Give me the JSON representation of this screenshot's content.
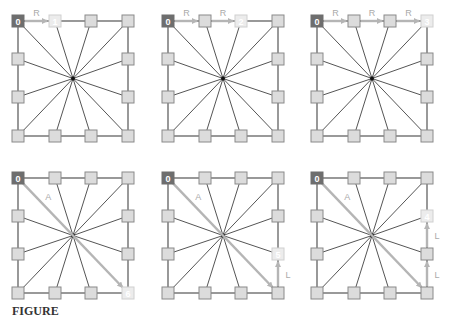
{
  "colors": {
    "background": "#ffffff",
    "edge": "#555555",
    "node_fill": "#dcdcdc",
    "node_stroke": "#8a8a8a",
    "start_fill": "#6e6e6e",
    "target_fill": "#ececec",
    "target_stroke": "#d0d0d0",
    "path": "#b5b5b5",
    "label": "#aaaaaa",
    "center": "#111111"
  },
  "grid": {
    "cols_offsets": [
      0,
      37,
      73,
      110
    ],
    "rows_offsets": [
      0,
      38,
      76,
      115
    ],
    "node_size": 12
  },
  "panels": [
    {
      "id": "panel-1",
      "origin": [
        18,
        21
      ],
      "start_label": "0",
      "target": {
        "col": 1,
        "row": 0,
        "label": "1"
      },
      "path": [
        {
          "from": [
            0,
            0
          ],
          "to": [
            1,
            0
          ],
          "label": "R"
        }
      ]
    },
    {
      "id": "panel-2",
      "origin": [
        168,
        21
      ],
      "start_label": "0",
      "target": {
        "col": 2,
        "row": 0,
        "label": "2"
      },
      "path": [
        {
          "from": [
            0,
            0
          ],
          "to": [
            1,
            0
          ],
          "label": "R"
        },
        {
          "from": [
            1,
            0
          ],
          "to": [
            2,
            0
          ],
          "label": "R"
        }
      ]
    },
    {
      "id": "panel-3",
      "origin": [
        317,
        21
      ],
      "start_label": "0",
      "target": {
        "col": 3,
        "row": 0,
        "label": "3"
      },
      "path": [
        {
          "from": [
            0,
            0
          ],
          "to": [
            1,
            0
          ],
          "label": "R"
        },
        {
          "from": [
            1,
            0
          ],
          "to": [
            2,
            0
          ],
          "label": "R"
        },
        {
          "from": [
            2,
            0
          ],
          "to": [
            3,
            0
          ],
          "label": "R"
        }
      ]
    },
    {
      "id": "panel-4",
      "origin": [
        18,
        178
      ],
      "start_label": "0",
      "target": {
        "col": 3,
        "row": 3,
        "label": "6"
      },
      "path": [
        {
          "from": [
            0,
            0
          ],
          "to": [
            3,
            3
          ],
          "label": "A"
        }
      ]
    },
    {
      "id": "panel-5",
      "origin": [
        168,
        178
      ],
      "start_label": "0",
      "target": {
        "col": 3,
        "row": 2,
        "label": "5"
      },
      "path": [
        {
          "from": [
            0,
            0
          ],
          "to": [
            3,
            3
          ],
          "label": "A"
        },
        {
          "from": [
            3,
            3
          ],
          "to": [
            3,
            2
          ],
          "label": "L"
        }
      ]
    },
    {
      "id": "panel-6",
      "origin": [
        317,
        178
      ],
      "start_label": "0",
      "target": {
        "col": 3,
        "row": 1,
        "label": "4"
      },
      "path": [
        {
          "from": [
            0,
            0
          ],
          "to": [
            3,
            3
          ],
          "label": "A"
        },
        {
          "from": [
            3,
            3
          ],
          "to": [
            3,
            2
          ],
          "label": "L"
        },
        {
          "from": [
            3,
            2
          ],
          "to": [
            3,
            1
          ],
          "label": "L"
        }
      ]
    }
  ],
  "caption": {
    "text": "FIGURE"
  }
}
